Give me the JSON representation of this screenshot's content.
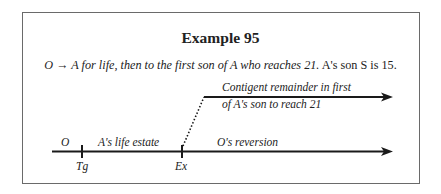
{
  "example": {
    "title": "Example 95",
    "rule_prefix": "O",
    "rule_arrow": "→",
    "rule_italic": "A for life, then to the first son of A who reaches 21.",
    "rule_plain": "A's son S is 15."
  },
  "diagram": {
    "upper_arrow": {
      "label_line1": "Contigent remainder in first",
      "label_line2": "of A's son to reach 21"
    },
    "timeline": {
      "start_label": "O",
      "segment1_label": "A's life estate",
      "segment2_label": "O's reversion",
      "ticks": [
        {
          "label": "Tg"
        },
        {
          "label": "Ex"
        }
      ]
    },
    "colors": {
      "line": "#1a1a1a",
      "frame": "#6a6a6a"
    }
  }
}
